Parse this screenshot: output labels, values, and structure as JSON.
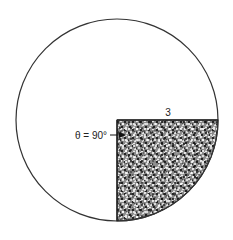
{
  "diagram": {
    "type": "circle-sector",
    "circle": {
      "cx": 117,
      "cy": 120,
      "r": 101,
      "stroke": "#333333"
    },
    "sector": {
      "start_angle_deg": 0,
      "end_angle_deg": 90,
      "quadrant": "lower-right",
      "fill": "#6b6b6b",
      "texture": "stipple"
    },
    "labels": {
      "radius": "3",
      "angle": "θ = 90°"
    },
    "colors": {
      "line": "#333333",
      "background": "#ffffff",
      "stipple_dark": "#2a2a2a",
      "stipple_light": "#f2f2f2"
    }
  }
}
